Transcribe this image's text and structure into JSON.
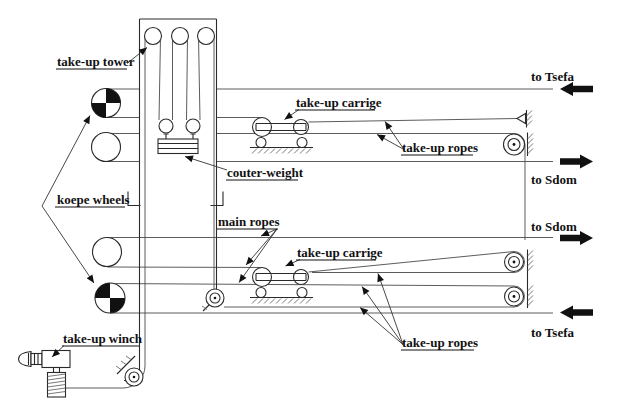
{
  "diagram": {
    "labels": {
      "take_up_tower": "take-up tower",
      "koepe_wheels": "koepe wheels",
      "couter_weight": "couter-weight",
      "main_ropes": "main ropes",
      "take_up_carrige_top": "take-up carrige",
      "take_up_carrige_bottom": "take-up carrige",
      "take_up_ropes_top": "take-up ropes",
      "take_up_ropes_bottom": "take-up ropes",
      "take_up_winch": "take-up winch",
      "to_tsefa_top": "to Tsefa",
      "to_sdom_top": "to Sdom",
      "to_sdom_bottom": "to Sdom",
      "to_tsefa_bottom": "to Tsefa"
    },
    "colors": {
      "background": "#ffffff",
      "line": "#2a2a2a",
      "arrow": "#111111"
    }
  }
}
